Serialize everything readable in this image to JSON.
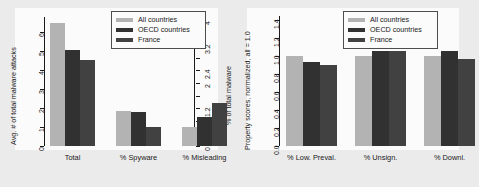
{
  "figure": {
    "background_color": "#ebebeb",
    "panel_color": "#fbfbfb"
  },
  "legend": {
    "position": "top-right",
    "entries": [
      {
        "label": "All countries",
        "color": "#b3b3b3"
      },
      {
        "label": "OECD countries",
        "color": "#313131"
      },
      {
        "label": "France",
        "color": "#414141"
      }
    ]
  },
  "chart_data": [
    {
      "type": "bar",
      "id": "malware-attacks-chart",
      "title": "",
      "xlabel": "",
      "ylabel": "Avg. # of total malware attacks",
      "y2label": "% of total malware",
      "categories": [
        "Total",
        "% Spyware",
        "% Misleading"
      ],
      "series": [
        {
          "name": "All countries",
          "color": "#b3b3b3",
          "values": [
            6.5,
            1.85,
            1.0
          ]
        },
        {
          "name": "OECD countries",
          "color": "#313131",
          "values": [
            5.05,
            1.78,
            1.52
          ]
        },
        {
          "name": "France",
          "color": "#414141",
          "values": [
            4.55,
            1.02,
            2.25
          ]
        }
      ],
      "ylim": [
        0,
        6.8
      ],
      "yticks": [
        0,
        1,
        2,
        3,
        4,
        5,
        6
      ],
      "yticklabels": [
        "0",
        "1",
        "2",
        "3",
        "4",
        "5",
        "6"
      ],
      "y2lim": [
        0,
        4.16
      ],
      "y2ticks": [
        0,
        0.4,
        0.8,
        1.2,
        1.6,
        2.0,
        2.4,
        2.8,
        3.2,
        3.6,
        4.0
      ],
      "y2ticklabels": [
        "0",
        "0.4",
        "",
        "1.2",
        "",
        "2",
        "2.4",
        "",
        "3.2",
        "",
        "4"
      ],
      "grid": false,
      "note": "Groups 2 and 3 are percentages read on the right axis"
    },
    {
      "type": "bar",
      "id": "property-scores-chart",
      "title": "",
      "xlabel": "",
      "ylabel": "Property scores, normalized, all = 1.0",
      "categories": [
        "% Low. Preval.",
        "% Unsign.",
        "% Downl."
      ],
      "series": [
        {
          "name": "All countries",
          "color": "#b3b3b3",
          "values": [
            1.0,
            1.0,
            1.0
          ]
        },
        {
          "name": "OECD countries",
          "color": "#313131",
          "values": [
            0.94,
            1.06,
            1.06
          ]
        },
        {
          "name": "France",
          "color": "#414141",
          "values": [
            0.9,
            1.06,
            0.97
          ]
        }
      ],
      "ylim": [
        0,
        1.45
      ],
      "yticks": [
        0.0,
        0.2,
        0.4,
        0.6,
        0.8,
        1.0,
        1.2,
        1.4
      ],
      "yticklabels": [
        "0.0",
        "0.2",
        "0.4",
        "0.6",
        "0.8",
        "1.0",
        "1.2",
        "1.4"
      ],
      "grid": false
    }
  ]
}
